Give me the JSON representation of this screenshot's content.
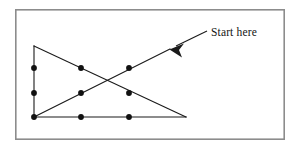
{
  "figure": {
    "background_color": "#ffffff",
    "frame": {
      "name": "outer-border",
      "x": 15,
      "y": 9,
      "width": 270,
      "height": 131,
      "stroke_color": "#8c8c8c",
      "stroke_width": 1.6
    },
    "annotation": {
      "label": "Start here",
      "text_x": 211,
      "text_y": 36,
      "font_size": 11.5,
      "color": "#141414",
      "arrow": {
        "tail_x": 207,
        "tail_y": 31,
        "tip_x": 170,
        "tip_y": 49,
        "stroke_color": "#1a1a1a",
        "stroke_width": 1.1,
        "head_points": "170,49 184,44 180,51 183,58"
      }
    },
    "line_color": "#1a1a1a",
    "line_width": 1.1,
    "dot_color": "#111111",
    "dot_radius": 2.9,
    "segments": [
      {
        "name": "left-vertical-edge",
        "x1": 34,
        "y1": 46,
        "x2": 34,
        "y2": 117
      },
      {
        "name": "bottom-horizontal-edge",
        "x1": 34,
        "y1": 117,
        "x2": 186,
        "y2": 117
      },
      {
        "name": "descending-hypotenuse",
        "x1": 34,
        "y1": 46,
        "x2": 186,
        "y2": 117
      },
      {
        "name": "ascending-diagonal",
        "x1": 34,
        "y1": 117,
        "x2": 170,
        "y2": 49
      }
    ],
    "dots": [
      {
        "name": "dot-left-upper",
        "cx": 34,
        "cy": 68
      },
      {
        "name": "dot-left-middle",
        "cx": 34,
        "cy": 93
      },
      {
        "name": "dot-left-bottom",
        "cx": 34,
        "cy": 117
      },
      {
        "name": "dot-mid-upper",
        "cx": 81,
        "cy": 68
      },
      {
        "name": "dot-mid-middle",
        "cx": 81,
        "cy": 93
      },
      {
        "name": "dot-mid-bottom",
        "cx": 81,
        "cy": 117
      },
      {
        "name": "dot-right-upper",
        "cx": 129,
        "cy": 68
      },
      {
        "name": "dot-right-middle",
        "cx": 129,
        "cy": 93
      },
      {
        "name": "dot-right-bottom",
        "cx": 129,
        "cy": 117
      }
    ]
  }
}
